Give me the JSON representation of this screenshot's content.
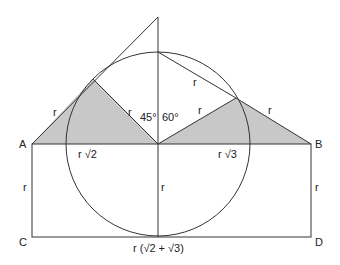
{
  "diagram": {
    "colors": {
      "stroke": "#333333",
      "shade": "#c8c8c8",
      "background": "#ffffff"
    },
    "points": {
      "A": {
        "label": "A"
      },
      "B": {
        "label": "B"
      },
      "C": {
        "label": "C"
      },
      "D": {
        "label": "D"
      }
    },
    "labels": {
      "left_tangent_r": "r",
      "left_radius_r": "r",
      "right_radius_r": "r",
      "right_side_r": "r",
      "chord_r": "r",
      "angle_45": "45°",
      "angle_60": "60°",
      "r_sqrt2": "r √2",
      "r_sqrt3": "r √3",
      "left_height_r": "r",
      "center_height_r": "r",
      "right_height_r": "r",
      "bottom_length": "r (√2 + √3)"
    }
  }
}
